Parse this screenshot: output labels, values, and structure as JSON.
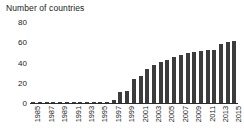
{
  "chart_data": {
    "type": "bar",
    "title": "Number of countries",
    "xlabel": "",
    "ylabel": "Number of countries",
    "ylim": [
      0,
      80
    ],
    "yticks": [
      0,
      20,
      40,
      60,
      80
    ],
    "grid": false,
    "legend": null,
    "bar_color": "#3c3c3c",
    "categories": [
      "1985",
      "1986",
      "1987",
      "1988",
      "1989",
      "1990",
      "1991",
      "1992",
      "1993",
      "1994",
      "1995",
      "1996",
      "1997",
      "1998",
      "1999",
      "2000",
      "2001",
      "2002",
      "2003",
      "2004",
      "2005",
      "2006",
      "2007",
      "2008",
      "2009",
      "2010",
      "2011",
      "2012",
      "2013",
      "2014",
      "2015"
    ],
    "xtick_labels": [
      "1985",
      "",
      "1987",
      "",
      "1989",
      "",
      "1991",
      "",
      "1993",
      "",
      "1995",
      "",
      "1997",
      "",
      "1999",
      "",
      "2001",
      "",
      "2003",
      "",
      "2005",
      "",
      "2007",
      "",
      "2009",
      "",
      "2011",
      "",
      "2013",
      "",
      "2015"
    ],
    "values": [
      1,
      1,
      1,
      1,
      1,
      1,
      1,
      1,
      1,
      1,
      1,
      1,
      3,
      11,
      12,
      24,
      27,
      34,
      38,
      41,
      42,
      45,
      47,
      49,
      50,
      51,
      52,
      52,
      58,
      60,
      61
    ]
  }
}
